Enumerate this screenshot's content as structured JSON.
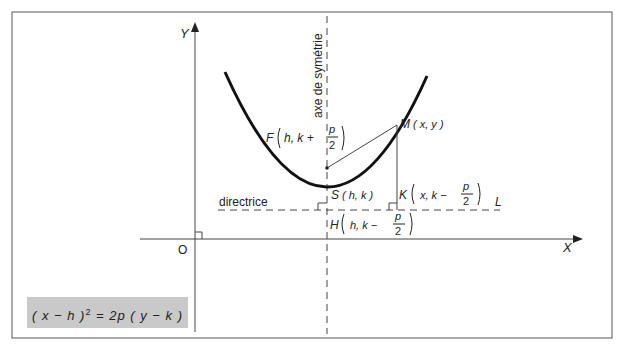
{
  "diagram": {
    "axes": {
      "x_label": "X",
      "y_label": "Y",
      "origin_label": "O"
    },
    "symmetry_axis_label": "axe de symétrie",
    "directrix_label": "directrice",
    "directrix_line_label": "L",
    "points": {
      "F": {
        "name": "F",
        "coords": "h, k +",
        "frac_num": "p",
        "frac_den": "2"
      },
      "M": {
        "name": "M",
        "coords": "( x, y )"
      },
      "S": {
        "name": "S",
        "coords": "( h, k )"
      },
      "K": {
        "name": "K",
        "coords": "x, k −",
        "frac_num": "p",
        "frac_den": "2"
      },
      "H": {
        "name": "H",
        "coords": "h, k −",
        "frac_num": "p",
        "frac_den": "2"
      }
    },
    "formula": {
      "left": "( x − h )",
      "exp": "2",
      "right": " = 2p ( y − k )"
    }
  },
  "colors": {
    "line": "#222222",
    "frame": "#555555",
    "formula_bg": "#c9c9c9"
  }
}
